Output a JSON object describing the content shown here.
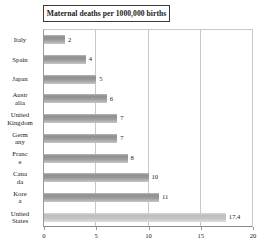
{
  "chart_data": {
    "type": "bar",
    "orientation": "horizontal",
    "title": "Maternal deaths per 1000,000 births",
    "xlabel": "",
    "ylabel": "",
    "xlim": [
      0,
      20
    ],
    "xticks": [
      0,
      5,
      10,
      15,
      20
    ],
    "xtick_labels": [
      "0",
      "5",
      "10",
      "15",
      "20"
    ],
    "grid": true,
    "legend": false,
    "categories": [
      "Italy",
      "Spain",
      "Japan",
      "Australia",
      "United Kingdom",
      "Germany",
      "France",
      "Canada",
      "Korea",
      "United States"
    ],
    "category_label_lines": [
      [
        "Italy"
      ],
      [
        "Spain"
      ],
      [
        "Japan"
      ],
      [
        "Austr",
        "alia"
      ],
      [
        "United",
        "Kingdom"
      ],
      [
        "Germ",
        "any"
      ],
      [
        "Franc",
        "e"
      ],
      [
        "Cana",
        "da"
      ],
      [
        "Kore",
        "a"
      ],
      [
        "United",
        "States"
      ]
    ],
    "values": [
      2,
      4,
      5,
      6,
      7,
      7,
      8,
      10,
      11,
      17.4
    ],
    "value_labels": [
      "2",
      "4",
      "5",
      "6",
      "7",
      "7",
      "8",
      "10",
      "11",
      "17.4"
    ],
    "bar_colors": [
      "#9a9a9a",
      "#9a9a9a",
      "#9a9a9a",
      "#9a9a9a",
      "#9a9a9a",
      "#9a9a9a",
      "#9a9a9a",
      "#9a9a9a",
      "#9a9a9a",
      "#c4c4c4"
    ],
    "highlight_index": 9
  }
}
